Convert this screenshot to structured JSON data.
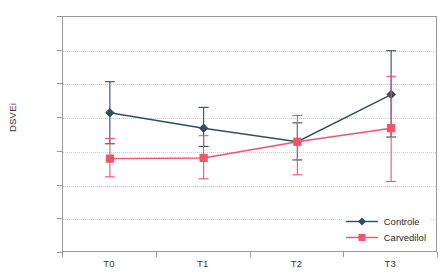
{
  "chart_data": {
    "type": "line",
    "title": "",
    "xlabel": "",
    "ylabel": "DSVEi",
    "categories": [
      "T0",
      "T1",
      "T2",
      "T3"
    ],
    "ylim": [
      4.0,
      7.5
    ],
    "ytick_labels": [
      "4,0",
      "4,5",
      "5,0",
      "5,5",
      "6,0",
      "6,5",
      "7,0",
      "7,5"
    ],
    "ytick_values": [
      4.0,
      4.5,
      5.0,
      5.5,
      6.0,
      6.5,
      7.0,
      7.5
    ],
    "grid": true,
    "legend_position": "bottom-right",
    "decimal_separator": ",",
    "series": [
      {
        "name": "Controle",
        "color": "#2d4f5e",
        "marker": "diamond",
        "values": [
          6.08,
          5.85,
          5.65,
          6.35
        ],
        "error_low": [
          5.62,
          5.58,
          5.38,
          5.72
        ],
        "error_high": [
          6.54,
          6.16,
          5.93,
          7.0
        ]
      },
      {
        "name": "Carvedilol",
        "color": "#f2536b",
        "marker": "square",
        "values": [
          5.4,
          5.41,
          5.65,
          5.85
        ],
        "error_low": [
          5.13,
          5.1,
          5.16,
          5.06
        ],
        "error_high": [
          5.7,
          5.74,
          6.04,
          6.62
        ]
      }
    ]
  },
  "axis": {
    "y_title": "DSVEi",
    "y_labels": [
      "7,5",
      "7,0",
      "6,5",
      "6,0",
      "5,5",
      "5,0",
      "4,5",
      "4,0"
    ],
    "x_labels": [
      "T0",
      "T1",
      "T2",
      "T3"
    ]
  },
  "legend": {
    "items": [
      {
        "label": "Controle",
        "color": "#2d4f5e"
      },
      {
        "label": "Carvedilol",
        "color": "#f2536b"
      }
    ]
  },
  "colors": {
    "controle": "#2d4f5e",
    "carvedilol": "#f2536b",
    "grid": "#e2c4c9",
    "frame": "#9a9a9a",
    "text": "#3a3a3a",
    "background": "#ffffff"
  }
}
